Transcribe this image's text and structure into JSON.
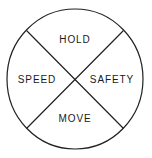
{
  "diagram": {
    "type": "circle-quadrant-wheel",
    "title": "",
    "shape": {
      "circle": {
        "center_x": 75,
        "center_y": 79,
        "radius_x": 68,
        "radius_y": 70,
        "stroke_color": "#222222",
        "stroke_width": 1.2,
        "fill_color": "#ffffff"
      },
      "divider_lines": [
        {
          "name": "diagonal-top-left-to-bottom-right",
          "x1": 27,
          "y1": 31,
          "x2": 123,
          "y2": 128,
          "stroke_color": "#222222",
          "stroke_width": 1.2
        },
        {
          "name": "diagonal-top-right-to-bottom-left",
          "x1": 123,
          "y1": 31,
          "x2": 27,
          "y2": 128,
          "stroke_color": "#222222",
          "stroke_width": 1.2
        }
      ]
    },
    "background_color": "#ffffff",
    "text_color": "#1a1a1a",
    "sectors": [
      {
        "position": "top",
        "label": "HOLD"
      },
      {
        "position": "left",
        "label": "SPEED"
      },
      {
        "position": "right",
        "label": "SAFETY"
      },
      {
        "position": "bottom",
        "label": "MOVE"
      }
    ]
  }
}
